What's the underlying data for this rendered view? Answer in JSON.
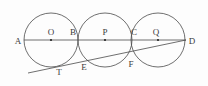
{
  "figure": {
    "kind": "geometry-diagram",
    "canvas": {
      "width": 208,
      "height": 86
    },
    "background_color": "#fdfdfd",
    "stroke_color": "#4a4a4a",
    "label_color": "#3b3b3b",
    "dot_color": "#222222",
    "baseline": {
      "name": "AD",
      "y": 40,
      "x_start": 24,
      "x_end": 186
    },
    "circles": [
      {
        "name": "circle-O",
        "cx": 51,
        "cy": 40,
        "r": 27
      },
      {
        "name": "circle-P",
        "cx": 105,
        "cy": 40,
        "r": 27
      },
      {
        "name": "circle-Q",
        "cx": 158,
        "cy": 40,
        "r": 27
      }
    ],
    "centers": [
      {
        "name": "O",
        "cx": 51,
        "cy": 40
      },
      {
        "name": "P",
        "cx": 105,
        "cy": 40
      },
      {
        "name": "Q",
        "cx": 158,
        "cy": 40
      }
    ],
    "tangent_line": {
      "name": "tangent-from-D",
      "x1": 28,
      "y1": 73,
      "x2": 186,
      "y2": 40
    },
    "labels": [
      {
        "text": "A",
        "x": 18,
        "y": 41
      },
      {
        "text": "O",
        "x": 51,
        "y": 32
      },
      {
        "text": "B",
        "x": 73,
        "y": 32
      },
      {
        "text": "P",
        "x": 105,
        "y": 32
      },
      {
        "text": "C",
        "x": 134,
        "y": 32
      },
      {
        "text": "Q",
        "x": 156,
        "y": 32
      },
      {
        "text": "D",
        "x": 192,
        "y": 41
      },
      {
        "text": "T",
        "x": 59,
        "y": 72
      },
      {
        "text": "E",
        "x": 84,
        "y": 67
      },
      {
        "text": "F",
        "x": 131,
        "y": 64
      }
    ]
  }
}
